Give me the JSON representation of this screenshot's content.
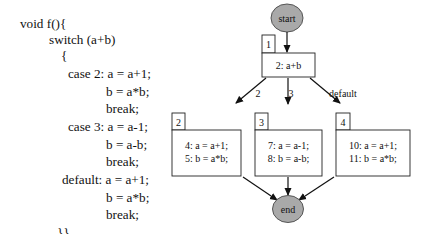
{
  "code": {
    "lines": [
      {
        "text": "void f(){",
        "x": 20,
        "y": 17
      },
      {
        "text": "switch (a+b)",
        "x": 49,
        "y": 33
      },
      {
        "text": "{",
        "x": 61,
        "y": 49
      },
      {
        "text": "case 2: a = a+1;",
        "x": 68,
        "y": 67
      },
      {
        "text": "b = a*b;",
        "x": 106,
        "y": 85
      },
      {
        "text": "break;",
        "x": 106,
        "y": 102
      },
      {
        "text": "case 3: a = a-1;",
        "x": 68,
        "y": 120
      },
      {
        "text": "b = a-b;",
        "x": 106,
        "y": 138
      },
      {
        "text": "break;",
        "x": 106,
        "y": 155
      },
      {
        "text": "default: a = a+1;",
        "x": 62,
        "y": 173
      },
      {
        "text": "b = a*b;",
        "x": 106,
        "y": 191
      },
      {
        "text": "break;",
        "x": 106,
        "y": 208
      },
      {
        "text": "}}",
        "x": 57,
        "y": 226
      }
    ]
  },
  "cfg": {
    "start": {
      "label": "start"
    },
    "end": {
      "label": "end"
    },
    "nodes": [
      {
        "id": "1",
        "lines": [
          "2: a+b"
        ]
      },
      {
        "id": "2",
        "lines": [
          "4: a = a+1;",
          "5: b = a*b;"
        ]
      },
      {
        "id": "3",
        "lines": [
          "7: a = a-1;",
          "8: b = a-b;"
        ]
      },
      {
        "id": "4",
        "lines": [
          "10: a = a+1;",
          "11: b = a*b;"
        ]
      }
    ],
    "edge_labels": {
      "case2": "2",
      "case3": "3",
      "default": "default"
    },
    "colors": {
      "terminal_fill": "#a9a9a9",
      "stroke": "#222222",
      "box_fill": "#ffffff"
    }
  }
}
